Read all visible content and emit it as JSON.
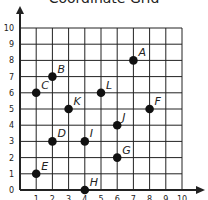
{
  "title": "Coordinate Grid",
  "chart_data": {
    "type": "scatter",
    "title": "Coordinate Grid",
    "xlabel": "",
    "ylabel": "",
    "xlim": [
      0,
      10
    ],
    "ylim": [
      0,
      10
    ],
    "grid": true,
    "x_ticks": [
      1,
      2,
      3,
      4,
      5,
      6,
      7,
      8,
      9,
      10
    ],
    "y_ticks": [
      0,
      1,
      2,
      3,
      4,
      5,
      6,
      7,
      8,
      9,
      10
    ],
    "points": [
      {
        "label": "A",
        "x": 7,
        "y": 8
      },
      {
        "label": "B",
        "x": 2,
        "y": 7
      },
      {
        "label": "C",
        "x": 1,
        "y": 6
      },
      {
        "label": "D",
        "x": 2,
        "y": 3
      },
      {
        "label": "E",
        "x": 1,
        "y": 1
      },
      {
        "label": "F",
        "x": 8,
        "y": 5
      },
      {
        "label": "G",
        "x": 6,
        "y": 2
      },
      {
        "label": "H",
        "x": 4,
        "y": 0
      },
      {
        "label": "I",
        "x": 4,
        "y": 3
      },
      {
        "label": "J",
        "x": 6,
        "y": 4
      },
      {
        "label": "K",
        "x": 3,
        "y": 5
      },
      {
        "label": "L",
        "x": 5,
        "y": 6
      }
    ]
  },
  "colors": {
    "grid": "#222222",
    "point": "#111111",
    "text": "#222222"
  }
}
